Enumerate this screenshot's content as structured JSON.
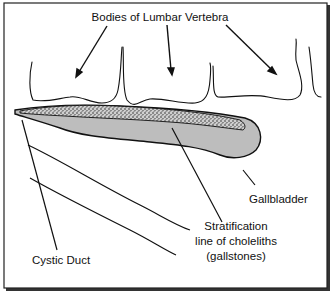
{
  "figure": {
    "labels": {
      "vertebra": "Bodies of Lumbar Vertebra",
      "gallbladder": "Gallbladder",
      "stratification_line1": "Stratification",
      "stratification_line2": "line of choleliths",
      "stratification_line3": "(gallstones)",
      "cystic_duct": "Cystic Duct"
    },
    "colors": {
      "border": "#222222",
      "gallbladder_fill": "#bdbdbd",
      "stones_fill": "#8a8a8a",
      "line": "#111111",
      "background": "#ffffff"
    }
  }
}
